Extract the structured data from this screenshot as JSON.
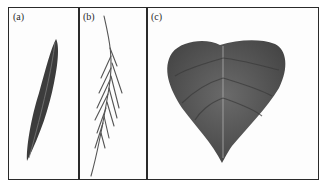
{
  "figure": {
    "panels": [
      {
        "label": "(a)",
        "subject": "lanceolate-leaf"
      },
      {
        "label": "(b)",
        "subject": "needle-leaf-branch"
      },
      {
        "label": "(c)",
        "subject": "cordate-leaf"
      }
    ],
    "colors": {
      "border": "#2a2a2a",
      "leaf_dark": "#3c3c3c",
      "leaf_mid": "#5a5a5a",
      "vein": "#9a9a9a",
      "background": "#fdfdfd"
    }
  }
}
